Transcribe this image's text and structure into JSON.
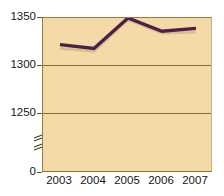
{
  "chart_data": {
    "type": "line",
    "title": "",
    "subtitle": "",
    "xlabel": "",
    "ylabel": "",
    "categories": [
      "2003",
      "2004",
      "2005",
      "2006",
      "2007"
    ],
    "series": [
      {
        "name": "series-primary",
        "color": "#4b1f4e",
        "values": [
          1322,
          1318,
          1350,
          1336,
          1339
        ]
      },
      {
        "name": "series-secondary",
        "color": "#d8c08a",
        "values": [
          1318,
          1315,
          1348,
          1334,
          1335
        ]
      }
    ],
    "ylim": [
      0,
      1350
    ],
    "yticks": [
      0,
      1250,
      1300,
      1350
    ],
    "ytick_labels": [
      "0",
      "1250",
      "1300",
      "1350"
    ],
    "gridlines": [
      "1350",
      "1300",
      "1250"
    ],
    "axis_break": true,
    "axis_break_between": [
      0,
      1250
    ],
    "grid": true,
    "legend": "none",
    "plot_background": "#f4daa6",
    "grid_color": "#8a6a2c",
    "axis_color": "#6b5524"
  },
  "axis": {
    "y_labels": [
      "1350",
      "1300",
      "1250",
      "0"
    ],
    "x_labels": [
      "2003",
      "2004",
      "2005",
      "2006",
      "2007"
    ]
  },
  "icons": {
    "axis_break": "axis-break-zigzag"
  }
}
